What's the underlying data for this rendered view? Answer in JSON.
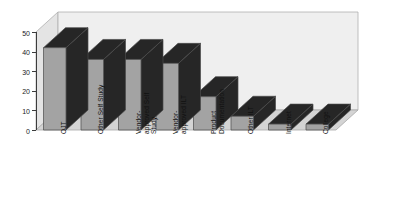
{
  "chart_data": {
    "type": "bar",
    "title": "",
    "subtitle": "",
    "xlabel": "",
    "ylabel": "",
    "categories": [
      "OJT",
      "Other Self Study",
      "Vendor-\napproved Self\nStudy",
      "Vendor-\napproved ILT",
      "Product\nDocumentation",
      "Other ILT",
      "Internet",
      "College"
    ],
    "values": [
      42,
      36,
      36,
      34,
      17,
      7,
      3,
      3
    ],
    "ylim": [
      0,
      50
    ],
    "yticks": [
      0,
      10,
      20,
      30,
      40,
      50
    ],
    "ytick_labels": [
      "0",
      "10",
      "20",
      "30",
      "40",
      "50"
    ],
    "grid": false,
    "legend": "none",
    "style": "3d-bar",
    "colors": {
      "bar_face": "#a3a3a3",
      "bar_side": "#262626",
      "bar_top": "#262626",
      "plot_background": "#eeeeee",
      "floor": "#d2d2d2",
      "axis": "#3c3c3c",
      "text": "#111111"
    }
  }
}
